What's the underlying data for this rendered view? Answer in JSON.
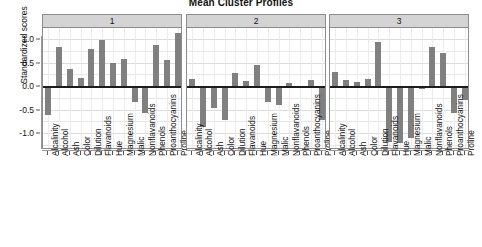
{
  "chart_data": {
    "type": "bar",
    "title": "Mean Cluster Profiles",
    "xlabel": "",
    "ylabel": "Standardized scores",
    "ylim": [
      -1.35,
      1.25
    ],
    "yticks": [
      "1.0",
      "0.5",
      "0.0",
      "-0.5",
      "-1.0"
    ],
    "ytick_values": [
      1.0,
      0.5,
      0.0,
      -0.5,
      -1.0
    ],
    "grid": true,
    "legend": "none",
    "panel_label_title": "cluster",
    "bar_color": "#808080",
    "strip_color": "#d4d4d4",
    "categories": [
      "Alcalinity",
      "Alcohol",
      "Ash",
      "Color",
      "Dilution",
      "Flavanoids",
      "Hue",
      "Magnesium",
      "Malic",
      "Nonflavanoids",
      "Phenols",
      "Proanthocyanins",
      "Proline"
    ],
    "panels": [
      {
        "label": "1",
        "values": [
          -0.62,
          0.83,
          0.36,
          0.17,
          0.78,
          0.97,
          0.48,
          0.57,
          -0.33,
          -0.57,
          0.87,
          0.55,
          1.12
        ]
      },
      {
        "label": "2",
        "values": [
          0.15,
          -0.87,
          -0.47,
          -0.73,
          0.28,
          0.1,
          0.45,
          -0.34,
          -0.4,
          0.06,
          -0.03,
          0.12,
          -0.72
        ]
      },
      {
        "label": "3",
        "values": [
          0.3,
          0.13,
          0.09,
          0.15,
          0.93,
          -1.2,
          -1.22,
          -1.1,
          -0.07,
          0.82,
          0.7,
          -0.57,
          -0.3
        ]
      }
    ]
  }
}
